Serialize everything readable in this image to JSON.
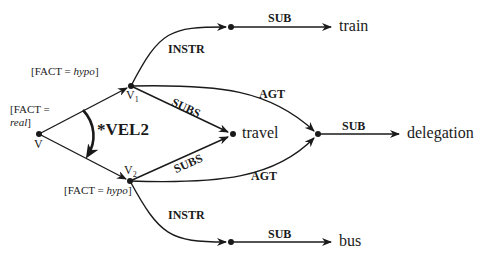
{
  "diagram": {
    "nodes": {
      "v": {
        "label": "V",
        "feature_prefix": "[FACT =",
        "feature_value": "real",
        "feature_suffix": "]"
      },
      "v1": {
        "label": "V",
        "subscript": "1",
        "feature_prefix": "[FACT = ",
        "feature_value": "hypo",
        "feature_suffix": "]"
      },
      "v2": {
        "label": "V",
        "subscript": "2",
        "feature_prefix": "[FACT = ",
        "feature_value": "hypo",
        "feature_suffix": "]"
      },
      "train": {
        "label": "train"
      },
      "travel": {
        "label": "travel"
      },
      "delegation": {
        "label": "delegation"
      },
      "bus": {
        "label": "bus"
      }
    },
    "edges": {
      "v1_instr": "INSTR",
      "top_sub": "SUB",
      "v1_subs": "SUBS",
      "v1_agt": "AGT",
      "v2_subs": "SUBS",
      "v2_agt": "AGT",
      "deleg_sub": "SUB",
      "v2_instr": "INSTR",
      "bottom_sub": "SUB"
    },
    "rule": "*VEL2",
    "colors": {
      "ink": "#1a1a1a",
      "background": "#ffffff"
    }
  }
}
